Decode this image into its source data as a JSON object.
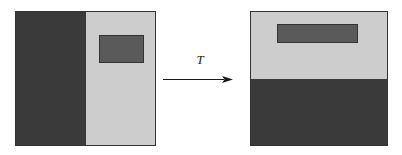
{
  "diagram": {
    "colors": {
      "dark": "#3a3a3a",
      "light": "#cdcdcd",
      "medium": "#5a5a5a",
      "outline": "#333333",
      "background": "#ffffff",
      "label": "#1a1a1a"
    },
    "source_panel": {
      "name": "source square",
      "regions": [
        {
          "label": "left dark half",
          "shade": "dark",
          "fill": "#3a3a3a"
        },
        {
          "label": "right light half",
          "shade": "light",
          "fill": "#cdcdcd"
        }
      ],
      "subrect": {
        "label": "dark rectangle in light half",
        "shade": "medium",
        "fill": "#5a5a5a"
      }
    },
    "transform": {
      "label": "T",
      "arrow": "right-arrow",
      "direction": "left-to-right"
    },
    "target_panel": {
      "name": "target square",
      "regions": [
        {
          "label": "top light half",
          "shade": "light",
          "fill": "#cdcdcd"
        },
        {
          "label": "bottom dark half",
          "shade": "dark",
          "fill": "#3a3a3a"
        }
      ],
      "subrect": {
        "label": "dark bar in light half",
        "shade": "medium",
        "fill": "#5a5a5a"
      }
    }
  }
}
